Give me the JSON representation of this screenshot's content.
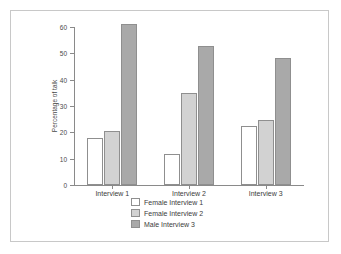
{
  "chart_data": {
    "type": "bar",
    "title": "",
    "xlabel": "",
    "ylabel": "Percentage of talk",
    "categories": [
      "Interview 1",
      "Interview 2",
      "Interview 3"
    ],
    "series": [
      {
        "name": "Female Interview 1",
        "color": "#ffffff",
        "values": [
          18.0,
          11.8,
          22.3
        ]
      },
      {
        "name": "Female Interview 2",
        "color": "#d2d2d2",
        "values": [
          20.5,
          34.8,
          24.5
        ]
      },
      {
        "name": "Male Interview 3",
        "color": "#a9a9a9",
        "values": [
          61.0,
          52.8,
          48.2
        ]
      }
    ],
    "ylim": [
      0,
      60
    ],
    "yticks": [
      0,
      10,
      20,
      30,
      40,
      50,
      60
    ],
    "ytick_labels": [
      "0",
      "10",
      "20",
      "30",
      "40",
      "50",
      "60"
    ],
    "grid": false,
    "legend_position": "bottom-center"
  },
  "legend": {
    "items": [
      {
        "label": "Female Interview 1"
      },
      {
        "label": "Female Interview 2"
      },
      {
        "label": "Male Interview 3"
      }
    ]
  },
  "colors": {
    "border": "#c8c8c8",
    "axis": "#8a8a8a",
    "text": "#3c3c3c",
    "bar_outline": "#8f8f8f"
  }
}
